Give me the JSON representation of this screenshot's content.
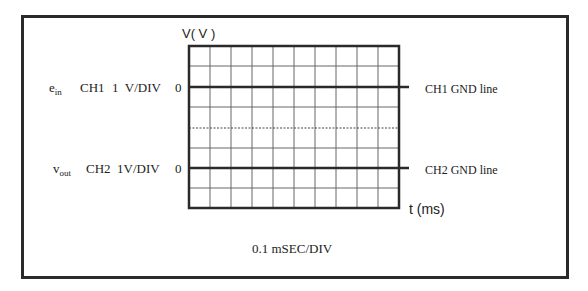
{
  "diagram": {
    "title_axis_y": "V( V )",
    "axis_x_label": "t (ms)",
    "timebase": "0.1 mSEC/DIV",
    "channels": [
      {
        "signal_main": "e",
        "signal_sub": "in",
        "channel": "CH1",
        "scale": "1  V/DIV",
        "zero_label": "0",
        "gnd_label": "CH1 GND line"
      },
      {
        "signal_main": "v",
        "signal_sub": "out",
        "channel": "CH2",
        "scale": "1V/DIV",
        "zero_label": "0",
        "gnd_label": "CH2 GND line"
      }
    ],
    "grid": {
      "columns": 10,
      "rows": 8
    },
    "colors": {
      "line": "#2a2a2a",
      "grid": "#555555",
      "background": "#ffffff"
    }
  }
}
